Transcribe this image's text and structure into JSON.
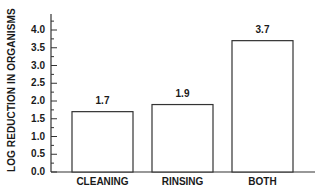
{
  "chart_data": {
    "type": "bar",
    "title": "",
    "xlabel": "",
    "ylabel": "LOG REDUCTION IN ORGANISMS",
    "categories": [
      "CLEANING",
      "RINSING",
      "BOTH"
    ],
    "values": [
      1.7,
      1.9,
      3.7
    ],
    "data_labels": [
      "1.7",
      "1.9",
      "3.7"
    ],
    "yticks": [
      "0.0",
      "0.5",
      "1.0",
      "1.5",
      "2.0",
      "2.5",
      "3.0",
      "3.5",
      "4.0"
    ],
    "ylim": [
      0,
      4.4
    ],
    "minor_ticks": true,
    "grid": false,
    "legend": null,
    "bar_fill": "#ffffff",
    "bar_edge": "#333333"
  }
}
